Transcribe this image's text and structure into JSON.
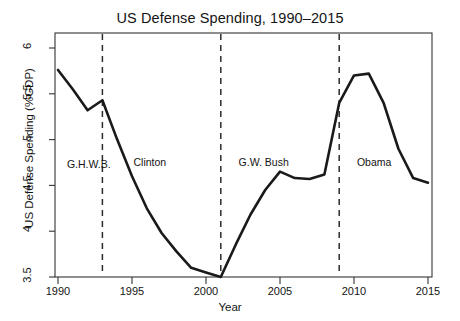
{
  "chart_data": {
    "type": "line",
    "title": "US Defense Spending, 1990–2015",
    "xlabel": "Year",
    "ylabel": "US Defense Spending (%GDP)",
    "xlim": [
      1990,
      2015
    ],
    "ylim": [
      3.5,
      6
    ],
    "xticks": [
      "1990",
      "1995",
      "2000",
      "2005",
      "2010",
      "2015"
    ],
    "xtick_values": [
      1990,
      1995,
      2000,
      2005,
      2010,
      2015
    ],
    "yticks": [
      "3.5",
      "4",
      "4.5",
      "5",
      "5.5",
      "6"
    ],
    "ytick_values": [
      3.5,
      4,
      4.5,
      5,
      5.5,
      6
    ],
    "grid": false,
    "legend": "none",
    "line_color": "#1a1a1a",
    "x": [
      1990,
      1991,
      1992,
      1993,
      1994,
      1995,
      1996,
      1997,
      1998,
      1999,
      2000,
      2001,
      2002,
      2003,
      2004,
      2005,
      2006,
      2007,
      2008,
      2009,
      2010,
      2011,
      2012,
      2013,
      2014,
      2015
    ],
    "values": [
      5.76,
      5.55,
      5.32,
      5.43,
      5.0,
      4.6,
      4.25,
      3.98,
      3.78,
      3.6,
      3.55,
      3.5,
      3.85,
      4.18,
      4.45,
      4.65,
      4.58,
      4.57,
      4.62,
      5.4,
      5.7,
      5.72,
      5.4,
      4.9,
      4.58,
      4.53
    ],
    "annotations": [
      {
        "label": "G.H.W.B.",
        "x": 1990.6,
        "y": 4.72
      },
      {
        "label": "Clinton",
        "x": 1995.1,
        "y": 4.75
      },
      {
        "label": "G.W. Bush",
        "x": 2002.2,
        "y": 4.75
      },
      {
        "label": "Obama",
        "x": 2010.2,
        "y": 4.75
      }
    ],
    "vertical_lines": [
      {
        "year": 1993,
        "style": "dashed",
        "label": "G.H.W.B.-to-Clinton transition"
      },
      {
        "year": 2001,
        "style": "dashed",
        "label": "Clinton-to-G.W.-Bush transition"
      },
      {
        "year": 2009,
        "style": "dashed",
        "label": "G.W.-Bush-to-Obama transition"
      }
    ]
  }
}
